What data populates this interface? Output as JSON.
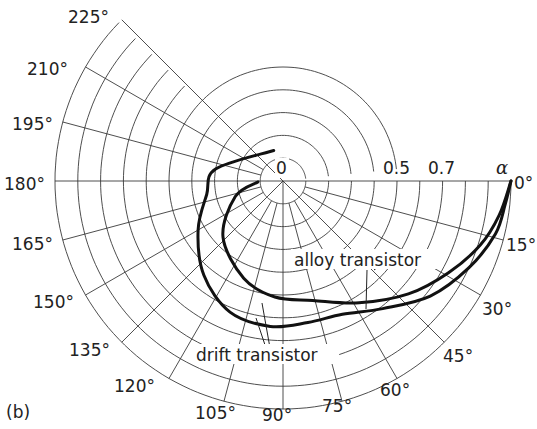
{
  "chart_data": {
    "type": "line",
    "subtype": "polar",
    "title": "",
    "panel_label": "(b)",
    "radial_axis": {
      "label": "α",
      "range": [
        0,
        1
      ],
      "rings": [
        0.1,
        0.2,
        0.3,
        0.4,
        0.5,
        0.6,
        0.7,
        0.8,
        0.9,
        1.0
      ],
      "tick_labels": [
        "0",
        "0.5",
        "0.7"
      ]
    },
    "angular_axis": {
      "direction": "clockwise",
      "zero_position": "right",
      "unit": "degrees",
      "ticks": [
        0,
        15,
        30,
        45,
        60,
        75,
        90,
        105,
        120,
        135,
        150,
        165,
        180,
        195,
        210,
        225
      ],
      "tick_labels": [
        "0°",
        "15°",
        "30°",
        "45°",
        "60°",
        "75°",
        "90°",
        "105°",
        "120°",
        "135°",
        "150°",
        "165°",
        "180°",
        "195°",
        "210°",
        "225°"
      ]
    },
    "series": [
      {
        "name": "drift transistor",
        "points_r_theta": [
          [
            1.0,
            0
          ],
          [
            0.98,
            6
          ],
          [
            0.96,
            14
          ],
          [
            0.9,
            25
          ],
          [
            0.82,
            38
          ],
          [
            0.71,
            52
          ],
          [
            0.64,
            66
          ],
          [
            0.63,
            80
          ],
          [
            0.64,
            95
          ],
          [
            0.62,
            112
          ],
          [
            0.54,
            130
          ],
          [
            0.43,
            150
          ],
          [
            0.34,
            170
          ],
          [
            0.3,
            190
          ],
          [
            0.14,
            253
          ]
        ]
      },
      {
        "name": "alloy transistor",
        "points_r_theta": [
          [
            1.0,
            0
          ],
          [
            0.96,
            9
          ],
          [
            0.91,
            18
          ],
          [
            0.83,
            29
          ],
          [
            0.74,
            42
          ],
          [
            0.63,
            58
          ],
          [
            0.54,
            76
          ],
          [
            0.51,
            94
          ],
          [
            0.46,
            112
          ],
          [
            0.36,
            137
          ],
          [
            0.22,
            162
          ],
          [
            0.11,
            178
          ]
        ]
      }
    ]
  },
  "labels": {
    "panel": "(b)",
    "alpha": "α",
    "r0": "0",
    "r05": "0.5",
    "r07": "0.7",
    "a0": "0°",
    "a15": "15°",
    "a30": "30°",
    "a45": "45°",
    "a60": "60°",
    "a75": "75°",
    "a90": "90°",
    "a105": "105°",
    "a120": "120°",
    "a135": "135°",
    "a150": "150°",
    "a165": "165°",
    "a180": "180°",
    "a195": "195°",
    "a210": "210°",
    "a225": "225°",
    "alloy": "alloy transistor",
    "drift": "drift transistor"
  }
}
